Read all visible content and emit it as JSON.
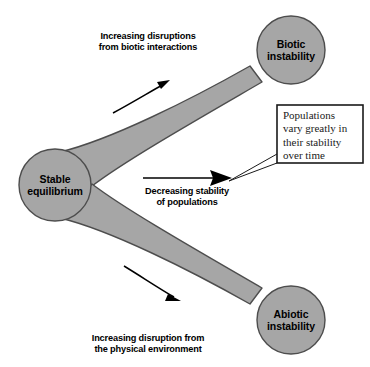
{
  "diagram": {
    "colors": {
      "band_fill": "#a6a6a6",
      "band_stroke": "#4d4d4d",
      "node_fill": "#a6a6a6",
      "node_stroke": "#4d4d4d",
      "arrow": "#000000",
      "callout_border": "#1a1a1a",
      "callout_fill": "#ffffff",
      "background": "#ffffff",
      "text": "#000000"
    },
    "nodes": [
      {
        "id": "stable-equilibrium",
        "lines": [
          "Stable",
          "equilibrium"
        ],
        "cx": 55,
        "cy": 185,
        "r": 36
      },
      {
        "id": "biotic-instability",
        "lines": [
          "Biotic",
          "instability"
        ],
        "cx": 291,
        "cy": 50,
        "r": 34
      },
      {
        "id": "abiotic-instability",
        "lines": [
          "Abiotic",
          "instability"
        ],
        "cx": 291,
        "cy": 320,
        "r": 34
      }
    ],
    "band_labels": [
      {
        "id": "upper-band-label",
        "lines": [
          "Increasing disruptions",
          "from biotic interactions"
        ]
      },
      {
        "id": "lower-band-label",
        "lines": [
          "Increasing disruption from",
          "the physical environment"
        ]
      }
    ],
    "center_arrow": {
      "id": "decreasing-stability-arrow",
      "lines": [
        "Decreasing stability",
        "of populations"
      ]
    },
    "callout": {
      "id": "populations-vary-callout",
      "lines": [
        "Populations",
        "vary greatly in",
        "their stability",
        "over time"
      ]
    }
  }
}
